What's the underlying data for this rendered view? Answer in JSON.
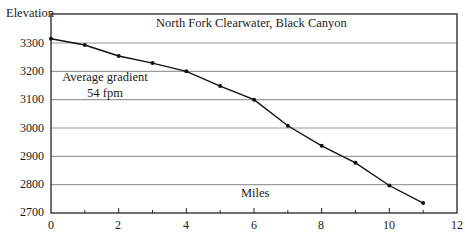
{
  "chart_data": {
    "type": "line",
    "title": "North Fork Clearwater, Black Canyon",
    "xlabel": "Miles",
    "ylabel": "Elevation",
    "annotation": [
      "Average gradient",
      "54 fpm"
    ],
    "x": [
      0,
      1,
      2,
      3,
      4,
      5,
      6,
      7,
      8,
      9,
      10,
      11
    ],
    "series": [
      {
        "name": "Elevation profile",
        "values": [
          3315,
          3293,
          3254,
          3229,
          3200,
          3148,
          3100,
          3008,
          2937,
          2877,
          2797,
          2735
        ]
      }
    ],
    "xlim": [
      0,
      12
    ],
    "ylim": [
      2700,
      3400
    ],
    "xticks": [
      "0",
      "2",
      "4",
      "6",
      "8",
      "10",
      "12"
    ],
    "yticks": [
      "2700",
      "2800",
      "2900",
      "3000",
      "3100",
      "3200",
      "3300"
    ],
    "grid": "horizontal",
    "legend": "none",
    "colors": {
      "line": "#111111",
      "grid": "#9a9a9a",
      "frame": "#222222"
    }
  }
}
